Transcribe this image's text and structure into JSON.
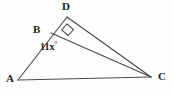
{
  "figure": {
    "kind": "geometry-diagram",
    "width": 173,
    "height": 95,
    "background_color": "#fefefe",
    "stroke_color": "#4a4a4a",
    "text_color": "#1d1d1d",
    "vertices": [
      {
        "id": "A",
        "label": "A",
        "x": 18,
        "y": 80
      },
      {
        "id": "B",
        "label": "B",
        "x": 51,
        "y": 33
      },
      {
        "id": "C",
        "label": "C",
        "x": 151,
        "y": 77
      },
      {
        "id": "D",
        "label": "D",
        "x": 67,
        "y": 17
      }
    ],
    "segments": [
      {
        "id": "AD",
        "from": "A",
        "to": "D",
        "note": "passes through B"
      },
      {
        "id": "AC",
        "from": "A",
        "to": "C"
      },
      {
        "id": "BC",
        "from": "B",
        "to": "C"
      },
      {
        "id": "DC",
        "from": "D",
        "to": "C"
      }
    ],
    "markers": [
      {
        "id": "right-angle-D",
        "type": "right-angle",
        "at": "D",
        "measure": "90",
        "points": "67,24 73,29 68,35 62,30"
      }
    ],
    "angle_labels": [
      {
        "id": "angle-B",
        "at": "B",
        "text": "11x",
        "degree_symbol": "°",
        "full_text": "11x°"
      }
    ]
  }
}
